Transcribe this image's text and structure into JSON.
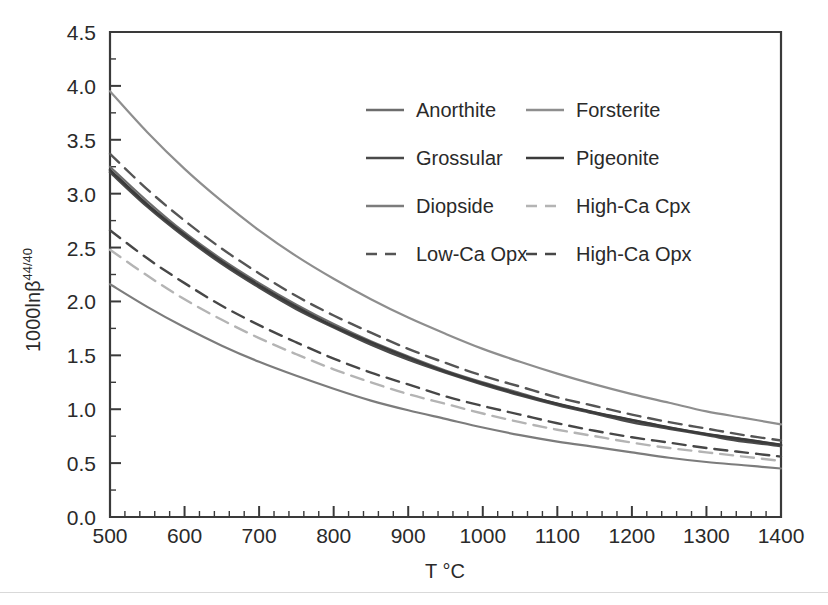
{
  "chart_data": {
    "type": "line",
    "title": "",
    "xlabel": "T °C",
    "ylabel": "1000lnβ",
    "ylabel_superscript": "44/40",
    "xlim": [
      500,
      1400
    ],
    "ylim": [
      0.0,
      4.5
    ],
    "grid": false,
    "x_ticks": [
      500,
      600,
      700,
      800,
      900,
      1000,
      1100,
      1200,
      1300,
      1400
    ],
    "x_tick_labels": [
      "500",
      "600",
      "700",
      "800",
      "900",
      "1000",
      "1100",
      "1200",
      "1300",
      "1400"
    ],
    "x_minor_step": 20,
    "y_ticks": [
      0.0,
      0.5,
      1.0,
      1.5,
      2.0,
      2.5,
      3.0,
      3.5,
      4.0,
      4.5
    ],
    "y_tick_labels": [
      "0.0",
      "0.5",
      "1.0",
      "1.5",
      "2.0",
      "2.5",
      "3.0",
      "3.5",
      "4.0",
      "4.5"
    ],
    "y_minor_step": 0.25,
    "x": [
      500,
      550,
      600,
      650,
      700,
      750,
      800,
      850,
      900,
      950,
      1000,
      1050,
      1100,
      1150,
      1200,
      1250,
      1300,
      1350,
      1400
    ],
    "series": [
      {
        "name": "Anorthite",
        "style": "solid",
        "color": "#6d6d6d",
        "width": 2.2,
        "values": [
          3.25,
          2.93,
          2.64,
          2.39,
          2.17,
          1.97,
          1.79,
          1.63,
          1.49,
          1.36,
          1.25,
          1.15,
          1.05,
          0.97,
          0.9,
          0.83,
          0.77,
          0.72,
          0.67
        ]
      },
      {
        "name": "Forsterite",
        "style": "solid",
        "color": "#8e8e8e",
        "width": 2.2,
        "values": [
          3.95,
          3.57,
          3.23,
          2.93,
          2.66,
          2.42,
          2.21,
          2.02,
          1.85,
          1.7,
          1.56,
          1.44,
          1.33,
          1.23,
          1.14,
          1.06,
          0.98,
          0.92,
          0.86
        ]
      },
      {
        "name": "Grossular",
        "style": "solid",
        "color": "#4a4a4a",
        "width": 2.6,
        "values": [
          3.2,
          2.88,
          2.6,
          2.35,
          2.13,
          1.93,
          1.76,
          1.6,
          1.46,
          1.34,
          1.23,
          1.13,
          1.04,
          0.96,
          0.88,
          0.82,
          0.76,
          0.7,
          0.66
        ]
      },
      {
        "name": "Pigeonite",
        "style": "solid",
        "color": "#3b3b3b",
        "width": 2.6,
        "values": [
          3.22,
          2.9,
          2.62,
          2.37,
          2.15,
          1.95,
          1.77,
          1.62,
          1.48,
          1.35,
          1.24,
          1.14,
          1.05,
          0.97,
          0.9,
          0.83,
          0.77,
          0.72,
          0.67
        ]
      },
      {
        "name": "Diopside",
        "style": "solid",
        "color": "#7c7c7c",
        "width": 2.2,
        "values": [
          2.16,
          1.95,
          1.76,
          1.59,
          1.44,
          1.31,
          1.19,
          1.08,
          0.99,
          0.91,
          0.83,
          0.76,
          0.7,
          0.65,
          0.6,
          0.55,
          0.51,
          0.48,
          0.45
        ]
      },
      {
        "name": "High-Ca Cpx",
        "style": "dashed",
        "color": "#b4b4b4",
        "width": 2.4,
        "values": [
          2.48,
          2.24,
          2.02,
          1.83,
          1.66,
          1.51,
          1.37,
          1.25,
          1.14,
          1.05,
          0.96,
          0.88,
          0.81,
          0.75,
          0.69,
          0.64,
          0.6,
          0.56,
          0.52
        ]
      },
      {
        "name": "Low-Ca Opx",
        "style": "dashed",
        "color": "#555555",
        "width": 2.4,
        "values": [
          3.37,
          3.04,
          2.75,
          2.49,
          2.26,
          2.05,
          1.87,
          1.71,
          1.56,
          1.43,
          1.31,
          1.21,
          1.11,
          1.03,
          0.95,
          0.88,
          0.82,
          0.76,
          0.71
        ]
      },
      {
        "name": "High-Ca Opx",
        "style": "dashed",
        "color": "#474747",
        "width": 2.4,
        "values": [
          2.66,
          2.4,
          2.17,
          1.96,
          1.78,
          1.62,
          1.47,
          1.34,
          1.23,
          1.12,
          1.03,
          0.95,
          0.87,
          0.8,
          0.74,
          0.69,
          0.64,
          0.6,
          0.56
        ]
      }
    ],
    "legend": {
      "position": "upper-center-inside",
      "columns": 2,
      "entries": [
        {
          "label": "Anorthite",
          "style": "solid",
          "color": "#6d6d6d"
        },
        {
          "label": "Forsterite",
          "style": "solid",
          "color": "#8e8e8e"
        },
        {
          "label": "Grossular",
          "style": "solid",
          "color": "#4a4a4a"
        },
        {
          "label": "Pigeonite",
          "style": "solid",
          "color": "#3b3b3b"
        },
        {
          "label": "Diopside",
          "style": "solid",
          "color": "#7c7c7c"
        },
        {
          "label": "High-Ca Cpx",
          "style": "dashed",
          "color": "#b4b4b4"
        },
        {
          "label": "Low-Ca Opx",
          "style": "dashed",
          "color": "#555555"
        },
        {
          "label": "High-Ca Opx",
          "style": "dashed",
          "color": "#474747"
        }
      ]
    }
  }
}
